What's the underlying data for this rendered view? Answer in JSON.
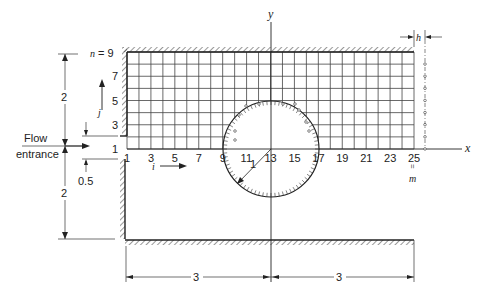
{
  "diagram": {
    "labels": {
      "flow_line1": "Flow",
      "flow_line2": "entrance",
      "y_axis": "y",
      "x_axis": "x",
      "n_eq": "n = 9",
      "j_label": "j",
      "i_label": "i",
      "h_label": "h",
      "m_label": "m",
      "m_eq": "=",
      "radius": "1",
      "dim_upper_height": "2",
      "dim_lower_height": "2",
      "dim_offset": "0.5",
      "dim_left_length": "3",
      "dim_right_length": "3"
    },
    "row_labels": [
      "1",
      "3",
      "5",
      "7"
    ],
    "col_labels": [
      "1",
      "3",
      "5",
      "7",
      "9",
      "11",
      "13",
      "15",
      "17",
      "19",
      "21",
      "23",
      "25"
    ],
    "grid": {
      "columns": 25,
      "rows": 9
    }
  }
}
